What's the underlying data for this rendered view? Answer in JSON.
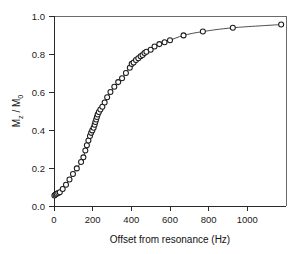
{
  "chart_data": {
    "type": "scatter",
    "title": "",
    "xlabel": "Offset from resonance (Hz)",
    "ylabel": "M_z / M_0",
    "ylabel_parts": {
      "m": "M",
      "sub_z": "z",
      "slash": " / ",
      "m2": "M",
      "sub_0": "0"
    },
    "xlim": [
      0,
      1200
    ],
    "ylim": [
      0.0,
      1.0
    ],
    "xticks": [
      0,
      200,
      400,
      600,
      800,
      1000
    ],
    "xtick_labels": [
      "0",
      "200",
      "400",
      "600",
      "800",
      "1000"
    ],
    "yticks": [
      0.0,
      0.2,
      0.4,
      0.6,
      0.8,
      1.0
    ],
    "ytick_labels": [
      "0.0",
      "0.2",
      "0.4",
      "0.6",
      "0.8",
      "1.0"
    ],
    "grid": false,
    "legend": false,
    "legend_position": "none",
    "marker": "open-circle",
    "marker_size": 5,
    "line_style": "solid-fit-curve",
    "series": [
      {
        "name": "Mz/M0 vs offset",
        "x": [
          2,
          8,
          14,
          22,
          30,
          45,
          62,
          80,
          98,
          118,
          140,
          152,
          162,
          170,
          178,
          186,
          192,
          198,
          205,
          210,
          214,
          218,
          222,
          226,
          232,
          240,
          250,
          262,
          275,
          292,
          312,
          332,
          352,
          372,
          392,
          402,
          412,
          424,
          436,
          448,
          458,
          468,
          478,
          500,
          520,
          545,
          572,
          600,
          670,
          770,
          925,
          1175
        ],
        "y": [
          0.055,
          0.06,
          0.065,
          0.068,
          0.072,
          0.09,
          0.112,
          0.14,
          0.168,
          0.198,
          0.232,
          0.256,
          0.292,
          0.32,
          0.345,
          0.368,
          0.385,
          0.398,
          0.412,
          0.428,
          0.442,
          0.455,
          0.468,
          0.482,
          0.495,
          0.508,
          0.522,
          0.545,
          0.572,
          0.6,
          0.628,
          0.652,
          0.672,
          0.7,
          0.728,
          0.748,
          0.755,
          0.768,
          0.778,
          0.788,
          0.795,
          0.805,
          0.812,
          0.822,
          0.84,
          0.852,
          0.862,
          0.872,
          0.898,
          0.918,
          0.938,
          0.955
        ]
      }
    ],
    "fit_curve": {
      "name": "fitted curve",
      "description": "smooth monotonic saturation curve through the data"
    }
  },
  "figure": {
    "background_color": "#ffffff",
    "axis_color": "#2a2a2a",
    "marker_edge_color": "#1b1b1b",
    "marker_fill_color": "#ffffff",
    "curve_color": "#3a3a3a"
  }
}
